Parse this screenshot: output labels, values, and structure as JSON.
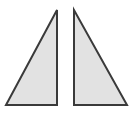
{
  "figure": {
    "width": 132,
    "height": 121,
    "background_color": "#ffffff"
  },
  "style": {
    "fill_color": "#e2e2e2",
    "stroke_color": "#3a3a3a",
    "stroke_width": 2
  },
  "shapes": [
    {
      "name": "left-triangle",
      "kind": "right-triangle",
      "right_angle_corner": "bottom-right",
      "orientation": "apex-top-right",
      "points": "57,10 57,105 6,105",
      "vertices": [
        {
          "label": "apex",
          "x": 57,
          "y": 10
        },
        {
          "label": "bottom-right",
          "x": 57,
          "y": 105
        },
        {
          "label": "bottom-left",
          "x": 6,
          "y": 105
        }
      ]
    },
    {
      "name": "right-triangle",
      "kind": "right-triangle",
      "right_angle_corner": "bottom-left",
      "orientation": "apex-top-left",
      "points": "74,10 74,105 127,105",
      "vertices": [
        {
          "label": "apex",
          "x": 74,
          "y": 10
        },
        {
          "label": "bottom-left",
          "x": 74,
          "y": 105
        },
        {
          "label": "bottom-right",
          "x": 127,
          "y": 105
        }
      ]
    }
  ]
}
